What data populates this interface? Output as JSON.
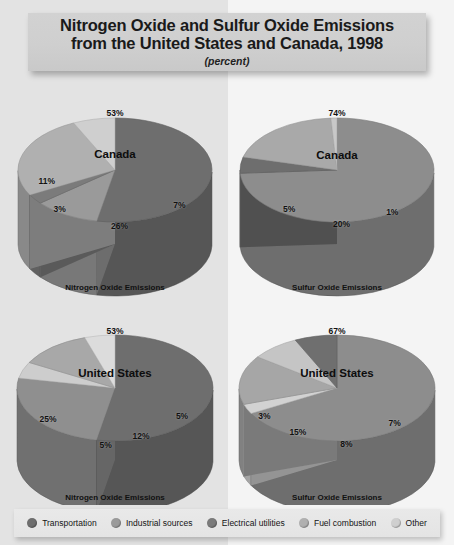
{
  "title": {
    "line1": "Nitrogen Oxide and Sulfur Oxide Emissions",
    "line2": "from the United States and Canada, 1998",
    "subtitle": "(percent)"
  },
  "legend": {
    "items": [
      {
        "label": "Transportation",
        "color": "#6e6e6e"
      },
      {
        "label": "Industrial sources",
        "color": "#9a9a9a"
      },
      {
        "label": "Electrical utilities",
        "color": "#7b7b7b"
      },
      {
        "label": "Fuel combustion",
        "color": "#b0b0b0"
      },
      {
        "label": "Other",
        "color": "#cfcfcf"
      }
    ]
  },
  "captions": {
    "nox": "Nitrogen Oxide Emissions",
    "sox": "Sulfur Oxide Emissions"
  },
  "chart_data": [
    {
      "type": "pie",
      "id": "canada-nox",
      "title": "Canada",
      "caption": "Nitrogen Oxide Emissions",
      "unit": "percent",
      "categories": [
        "Transportation",
        "Industrial sources",
        "Electrical utilities",
        "Fuel combustion",
        "Other"
      ],
      "values": [
        53,
        11,
        3,
        26,
        7
      ],
      "labels": [
        "53%",
        "11%",
        "3%",
        "26%",
        "7%"
      ],
      "colors": [
        "#6e6e6e",
        "#9a9a9a",
        "#7b7b7b",
        "#b0b0b0",
        "#cfcfcf"
      ]
    },
    {
      "type": "pie",
      "id": "canada-sox",
      "title": "Canada",
      "caption": "Sulfur Oxide Emissions",
      "unit": "percent",
      "categories": [
        "Transportation",
        "Industrial sources",
        "Electrical utilities",
        "Fuel combustion",
        "Other"
      ],
      "values": [
        74,
        5,
        20,
        1,
        0
      ],
      "labels": [
        "74%",
        "5%",
        "20%",
        "1%"
      ],
      "colors": [
        "#8d8d8d",
        "#6e6e6e",
        "#a9a9a9",
        "#c8c8c8",
        "#cfcfcf"
      ]
    },
    {
      "type": "pie",
      "id": "us-nox",
      "title": "United States",
      "caption": "Nitrogen Oxide Emissions",
      "unit": "percent",
      "categories": [
        "Transportation",
        "Industrial sources",
        "Electrical utilities",
        "Fuel combustion",
        "Other"
      ],
      "values": [
        53,
        25,
        5,
        12,
        5
      ],
      "labels": [
        "53%",
        "25%",
        "5%",
        "12%",
        "5%"
      ],
      "colors": [
        "#6e6e6e",
        "#8f8f8f",
        "#cdcdcd",
        "#a8a8a8",
        "#dcdcdc"
      ]
    },
    {
      "type": "pie",
      "id": "us-sox",
      "title": "United States",
      "caption": "Sulfur Oxide Emissions",
      "unit": "percent",
      "categories": [
        "Transportation",
        "Industrial sources",
        "Electrical utilities",
        "Fuel combustion",
        "Other"
      ],
      "values": [
        67,
        3,
        15,
        8,
        7
      ],
      "labels": [
        "67%",
        "3%",
        "15%",
        "8%",
        "7%"
      ],
      "colors": [
        "#8d8d8d",
        "#d2d2d2",
        "#a6a6a6",
        "#c5c5c5",
        "#6f6f6f"
      ]
    }
  ]
}
